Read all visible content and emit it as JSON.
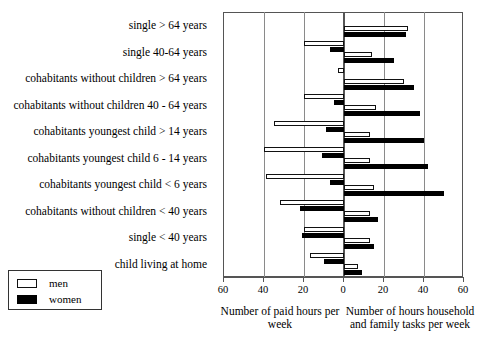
{
  "chart_data": {
    "type": "bar",
    "orientation": "horizontal",
    "layout": "diverging-paired",
    "title": "",
    "xlabel_left": "Number of paid hours per week",
    "xlabel_right": "Number of hours household and family tasks per week",
    "ylabel": "",
    "grid": true,
    "legend_position": "bottom-left",
    "legend": [
      "men",
      "women"
    ],
    "axis": {
      "tick_labels": [
        "60",
        "40",
        "20",
        "0",
        "20",
        "40",
        "60"
      ],
      "tick_values": [
        -60,
        -40,
        -20,
        0,
        20,
        40,
        60
      ],
      "xlim": [
        -60,
        60
      ],
      "left_axis_max": 60,
      "right_axis_max": 60
    },
    "categories": [
      "single > 64 years",
      "single 40-64 years",
      "cohabitants without children > 64 years",
      "cohabitants without children 40 - 64 years",
      "cohabitants youngest child > 14 years",
      "cohabitants youngest child 6 - 14 years",
      "cohabitants youngest child < 6 years",
      "cohabitants without children < 40 years",
      "single < 40 years",
      "child living at home"
    ],
    "series": [
      {
        "name": "men",
        "side": "left",
        "measure": "paid hours per week",
        "values": [
          0,
          20,
          3,
          20,
          35,
          40,
          39,
          32,
          20,
          17
        ]
      },
      {
        "name": "women",
        "side": "left",
        "measure": "paid hours per week",
        "values": [
          0,
          7,
          0,
          5,
          9,
          11,
          7,
          22,
          21,
          10
        ]
      },
      {
        "name": "men",
        "side": "right",
        "measure": "household and family tasks hours per week",
        "values": [
          32,
          14,
          30,
          16,
          13,
          13,
          15,
          13,
          13,
          7
        ]
      },
      {
        "name": "women",
        "side": "right",
        "measure": "household and family tasks hours per week",
        "values": [
          31,
          25,
          35,
          38,
          40,
          42,
          50,
          17,
          15,
          9
        ]
      }
    ]
  },
  "legend": {
    "men_label": "men",
    "women_label": "women"
  },
  "captions": {
    "left": "Number of paid hours per week",
    "right": "Number of hours household and family tasks per week"
  },
  "colors": {
    "men_fill": "#ffffff",
    "women_fill": "#000000",
    "outline": "#111111",
    "grid": "#8a8a8a",
    "axis": "#555555",
    "background": "#ffffff"
  }
}
